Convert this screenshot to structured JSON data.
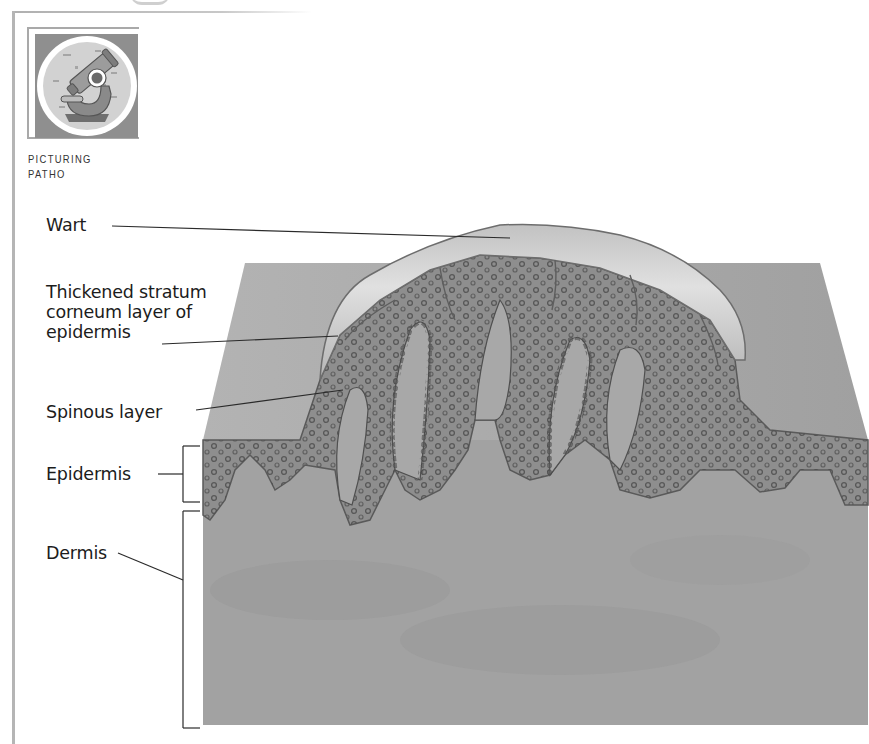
{
  "badge": {
    "icon": "microscope-icon",
    "caption_line1": "PICTURING",
    "caption_line2": "PATHO"
  },
  "figure": {
    "labels": {
      "wart": "Wart",
      "stratum_line1": "Thickened stratum",
      "stratum_line2": "corneum layer of",
      "stratum_line3": "epidermis",
      "spinous": "Spinous layer",
      "epidermis": "Epidermis",
      "dermis": "Dermis"
    }
  },
  "colors": {
    "skin_block": "#a3a3a3",
    "dermis": "#9e9e9e",
    "epidermis": "#8c8c8c",
    "wart_cap": "#cfcfcf",
    "nuclei": "#4a4a4a",
    "leader_lines": "#2a2a2a",
    "frame": "#b5b5b5"
  }
}
